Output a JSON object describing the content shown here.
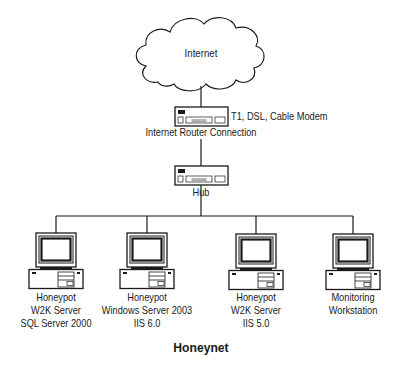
{
  "diagram": {
    "title": "Honeynet",
    "cloud": {
      "label": "Internet",
      "icon": "cloud-icon"
    },
    "router": {
      "label": "Internet Router Connection",
      "side_label": "T1, DSL, Cable Modem",
      "icon": "router-icon"
    },
    "hub": {
      "label": "Hub",
      "icon": "hub-icon"
    },
    "computers": [
      {
        "icon": "computer-icon",
        "lines": [
          "Honeypot",
          "W2K Server",
          "SQL Server 2000"
        ]
      },
      {
        "icon": "computer-icon",
        "lines": [
          "Honeypot",
          "Windows Server 2003",
          "IIS 6.0"
        ]
      },
      {
        "icon": "computer-icon",
        "lines": [
          "Honeypot",
          "W2K Server",
          "IIS 5.0"
        ]
      },
      {
        "icon": "computer-icon",
        "lines": [
          "Monitoring",
          "Workstation"
        ]
      }
    ],
    "colors": {
      "line": "#1a1a1a",
      "background": "#ffffff",
      "screen": "#ffffff"
    }
  }
}
